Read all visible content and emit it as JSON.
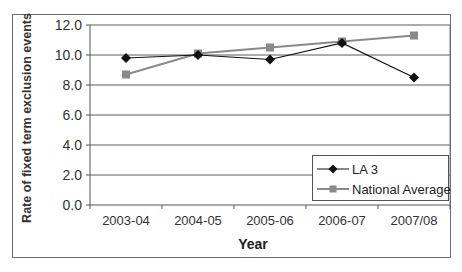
{
  "chart_data": {
    "type": "line",
    "title": "",
    "xlabel": "Year",
    "ylabel": "Rate of fixed term exclusion events",
    "categories": [
      "2003-04",
      "2004-05",
      "2005-06",
      "2006-07",
      "2007/08"
    ],
    "series": [
      {
        "name": "LA 3",
        "marker": "diamond",
        "color": "#111111",
        "values": [
          9.8,
          10.0,
          9.7,
          10.8,
          8.5
        ]
      },
      {
        "name": "National Average",
        "marker": "square",
        "color": "#8a8a8a",
        "values": [
          8.7,
          10.1,
          10.5,
          10.9,
          11.3
        ]
      }
    ],
    "ylim": [
      0,
      12
    ],
    "yticks": [
      "0.0",
      "2.0",
      "4.0",
      "6.0",
      "8.0",
      "10.0",
      "12.0"
    ],
    "grid": true,
    "legend_position": "lower right inside plot"
  },
  "axes": {
    "ylabel": "Rate of fixed term exclusion events",
    "xlabel": "Year"
  },
  "legend": {
    "items": [
      "LA 3",
      "National Average"
    ]
  }
}
